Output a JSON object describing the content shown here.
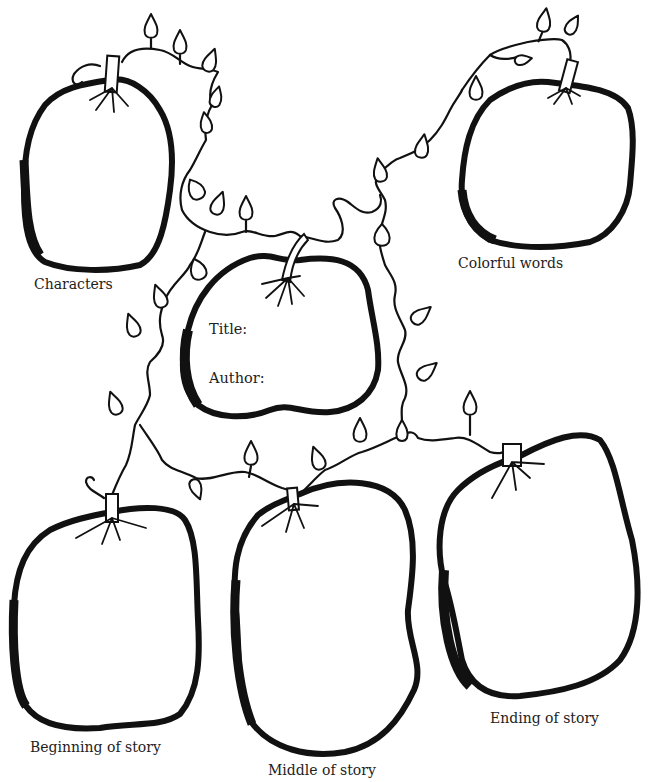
{
  "worksheet": {
    "type": "story map graphic organizer",
    "center_apple": {
      "title_label": "Title:",
      "author_label": "Author:"
    },
    "apples": [
      {
        "id": "characters",
        "label": "Characters"
      },
      {
        "id": "colorful-words",
        "label": "Colorful words"
      },
      {
        "id": "beginning",
        "label": "Beginning of story"
      },
      {
        "id": "middle",
        "label": "Middle of story"
      },
      {
        "id": "ending",
        "label": "Ending of story"
      }
    ],
    "colors": {
      "ink": "#111111",
      "paper": "#ffffff",
      "text": "#222222"
    }
  }
}
